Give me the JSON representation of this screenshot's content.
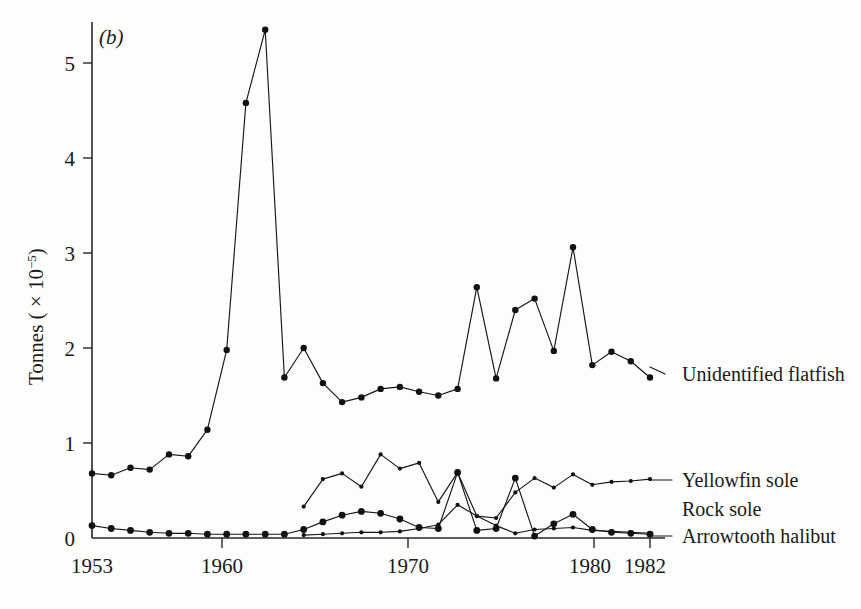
{
  "panel_label": "(b)",
  "chart_data": {
    "type": "line",
    "title": "",
    "subtitle": "",
    "panel": "(b)",
    "xlabel": "",
    "ylabel": "Tonnes ( × 10⁻⁵)",
    "ylabel_parts": {
      "text": "Tonnes ( × 10",
      "exponent": "−5",
      "close": ")"
    },
    "xlim": [
      1953,
      1982
    ],
    "ylim": [
      0,
      5.5
    ],
    "xticks": [
      1953,
      1960,
      1970,
      1980,
      1982
    ],
    "xtick_labels": [
      "1953",
      "1960",
      "1970",
      "1980",
      "1982"
    ],
    "yticks": [
      0,
      1,
      2,
      3,
      4,
      5
    ],
    "ytick_labels": [
      "0",
      "1",
      "2",
      "3",
      "4",
      "5"
    ],
    "grid": false,
    "legend_position": "right-inline",
    "marker_style": "filled-circle",
    "line_color": "#161616",
    "x": [
      1953,
      1954,
      1955,
      1956,
      1957,
      1958,
      1959,
      1960,
      1961,
      1962,
      1963,
      1964,
      1965,
      1966,
      1967,
      1968,
      1969,
      1970,
      1971,
      1972,
      1973,
      1974,
      1975,
      1976,
      1977,
      1978,
      1979,
      1980,
      1981,
      1982
    ],
    "series": [
      {
        "name": "Unidentified flatfish",
        "label": "Unidentified flatfish",
        "marker": "large-circle",
        "x": [
          1953,
          1954,
          1955,
          1956,
          1957,
          1958,
          1959,
          1960,
          1961,
          1962,
          1963,
          1964,
          1965,
          1966,
          1967,
          1968,
          1969,
          1970,
          1971,
          1972,
          1973,
          1974,
          1975,
          1976,
          1977,
          1978,
          1979,
          1980,
          1981,
          1982
        ],
        "values": [
          0.68,
          0.66,
          0.74,
          0.72,
          0.88,
          0.86,
          1.14,
          1.98,
          4.58,
          5.35,
          1.69,
          2.0,
          1.63,
          1.43,
          1.48,
          1.57,
          1.59,
          1.54,
          1.5,
          1.57,
          2.64,
          1.68,
          2.4,
          2.52,
          1.97,
          3.06,
          1.82,
          1.96,
          1.86,
          1.69
        ]
      },
      {
        "name": "Yellowfin sole",
        "label": "Yellowfin sole",
        "marker": "small-circle",
        "x": [
          1964,
          1965,
          1966,
          1967,
          1968,
          1969,
          1970,
          1971,
          1972,
          1973,
          1974,
          1975,
          1976,
          1977,
          1978,
          1979,
          1980,
          1981,
          1982
        ],
        "values": [
          0.33,
          0.62,
          0.68,
          0.54,
          0.88,
          0.73,
          0.79,
          0.38,
          0.69,
          0.23,
          0.21,
          0.48,
          0.63,
          0.53,
          0.67,
          0.56,
          0.59,
          0.6,
          0.62
        ]
      },
      {
        "name": "Rock sole",
        "label": "Rock sole",
        "marker": "medium-circle",
        "x": [
          1953,
          1954,
          1955,
          1956,
          1957,
          1958,
          1959,
          1960,
          1961,
          1962,
          1963,
          1964,
          1965,
          1966,
          1967,
          1968,
          1969,
          1970,
          1971,
          1972,
          1973,
          1974,
          1975,
          1976,
          1977,
          1978,
          1979,
          1980,
          1981,
          1982
        ],
        "values": [
          0.13,
          0.1,
          0.08,
          0.06,
          0.05,
          0.05,
          0.04,
          0.04,
          0.04,
          0.04,
          0.04,
          0.09,
          0.17,
          0.24,
          0.28,
          0.26,
          0.2,
          0.11,
          0.1,
          0.69,
          0.08,
          0.1,
          0.63,
          0.02,
          0.15,
          0.25,
          0.09,
          0.06,
          0.05,
          0.04
        ]
      },
      {
        "name": "Arrowtooth halibut",
        "label": "Arrowtooth halibut",
        "marker": "small-circle",
        "x": [
          1964,
          1965,
          1966,
          1967,
          1968,
          1969,
          1970,
          1971,
          1972,
          1973,
          1974,
          1975,
          1976,
          1977,
          1978,
          1979,
          1980,
          1981,
          1982
        ],
        "values": [
          0.03,
          0.04,
          0.05,
          0.06,
          0.06,
          0.07,
          0.1,
          0.14,
          0.35,
          0.23,
          0.13,
          0.05,
          0.09,
          0.1,
          0.11,
          0.08,
          0.07,
          0.06,
          0.05
        ]
      }
    ]
  },
  "series_labels": {
    "unidentified_flatfish": "Unidentified flatfish",
    "yellowfin_sole": "Yellowfin sole",
    "rock_sole": "Rock sole",
    "arrowtooth_halibut": "Arrowtooth halibut"
  },
  "colors": {
    "ink": "#161616",
    "axis": "#262626",
    "background": "#fdfdfc"
  }
}
